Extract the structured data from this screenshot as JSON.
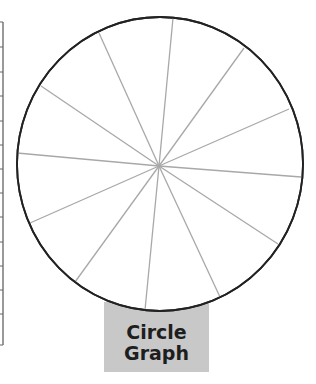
{
  "label": {
    "line1": "Circle",
    "line2": "Graph",
    "background": "#c8c8c8",
    "color": "#1e1e1e"
  },
  "circle": {
    "cx": 160,
    "cy": 164,
    "rx": 143,
    "ry": 147,
    "stroke": "#222222",
    "spoke_color": "#a8a8a8",
    "center": [
      159,
      166
    ],
    "spoke_endpoints": [
      [
        173,
        18
      ],
      [
        244,
        48
      ],
      [
        289,
        109
      ],
      [
        301,
        177
      ],
      [
        278,
        244
      ],
      [
        220,
        297
      ],
      [
        145,
        310
      ],
      [
        75,
        282
      ],
      [
        30,
        223
      ],
      [
        17,
        153
      ],
      [
        41,
        86
      ],
      [
        99,
        33
      ]
    ],
    "slice_count": 12
  },
  "table_edge": {
    "top": 22,
    "bottom": 345,
    "x": 3,
    "row_lines": [
      22,
      47,
      72,
      96,
      121,
      145,
      169,
      193,
      217,
      242,
      266,
      290,
      314,
      345
    ]
  }
}
